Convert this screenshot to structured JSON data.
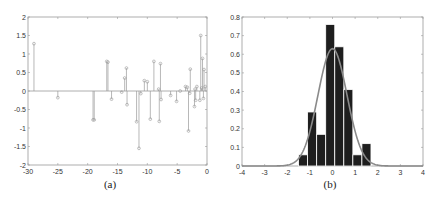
{
  "captions": {
    "a": "(a)",
    "b": "(b)"
  },
  "chart_data": [
    {
      "id": "a",
      "type": "stem",
      "title": "",
      "xlabel": "",
      "ylabel": "",
      "xlim": [
        -30,
        0
      ],
      "ylim": [
        -2,
        2
      ],
      "xticks": [
        -30,
        -25,
        -20,
        -15,
        -10,
        -5,
        0
      ],
      "yticks": [
        -2,
        -1.5,
        -1,
        -0.5,
        0,
        0.5,
        1,
        1.5,
        2
      ],
      "grid": false,
      "color": "#999999",
      "points": [
        {
          "x": -29,
          "y": 1.28
        },
        {
          "x": -25,
          "y": -0.18
        },
        {
          "x": -19.1,
          "y": -0.78
        },
        {
          "x": -18.9,
          "y": -0.78
        },
        {
          "x": -16.8,
          "y": 0.8
        },
        {
          "x": -16.6,
          "y": 0.78
        },
        {
          "x": -16,
          "y": -0.22
        },
        {
          "x": -14.3,
          "y": -0.03
        },
        {
          "x": -13.8,
          "y": 0.35
        },
        {
          "x": -13.5,
          "y": 0.62
        },
        {
          "x": -13.4,
          "y": -0.37
        },
        {
          "x": -11.8,
          "y": -0.83
        },
        {
          "x": -11.4,
          "y": -1.55
        },
        {
          "x": -11.1,
          "y": -0.07
        },
        {
          "x": -10.5,
          "y": 0.28
        },
        {
          "x": -10,
          "y": 0.25
        },
        {
          "x": -9.5,
          "y": -0.76
        },
        {
          "x": -8.9,
          "y": 0.8
        },
        {
          "x": -8.1,
          "y": 0.05
        },
        {
          "x": -8.0,
          "y": -0.82
        },
        {
          "x": -7.8,
          "y": 0.74
        },
        {
          "x": -7.7,
          "y": -0.23
        },
        {
          "x": -6.1,
          "y": -0.12
        },
        {
          "x": -5.1,
          "y": -0.28
        },
        {
          "x": -4.5,
          "y": 0.0
        },
        {
          "x": -3.6,
          "y": 0.12
        },
        {
          "x": -3.3,
          "y": 0.1
        },
        {
          "x": -3.1,
          "y": -1.08
        },
        {
          "x": -2.9,
          "y": -0.06
        },
        {
          "x": -2.8,
          "y": 0.59
        },
        {
          "x": -2.1,
          "y": -0.42
        },
        {
          "x": -2.0,
          "y": 0.05
        },
        {
          "x": -1.9,
          "y": -0.25
        },
        {
          "x": -1.7,
          "y": 0.12
        },
        {
          "x": -1.2,
          "y": -0.25
        },
        {
          "x": -1.05,
          "y": 1.5
        },
        {
          "x": -0.9,
          "y": 0.08
        },
        {
          "x": -0.75,
          "y": 0.88
        },
        {
          "x": -0.6,
          "y": -0.2
        },
        {
          "x": -0.5,
          "y": 0.58
        },
        {
          "x": -0.3,
          "y": 0.12
        }
      ]
    },
    {
      "id": "b",
      "type": "bar",
      "title": "",
      "xlabel": "",
      "ylabel": "",
      "xlim": [
        -4,
        4
      ],
      "ylim": [
        0,
        0.8
      ],
      "xticks": [
        -4,
        -3,
        -2,
        -1,
        0,
        1,
        2,
        3,
        4
      ],
      "yticks": [
        0,
        0.1,
        0.2,
        0.3,
        0.4,
        0.5,
        0.6,
        0.7,
        0.8
      ],
      "grid": false,
      "bar_color": "#1e1e1e",
      "bar_edge": "#ffffff",
      "bin_width": 0.4,
      "bin_centers": [
        -1.3,
        -0.9,
        -0.5,
        -0.1,
        0.3,
        0.7,
        1.1,
        1.5
      ],
      "values": [
        0.06,
        0.29,
        0.17,
        0.76,
        0.64,
        0.41,
        0.06,
        0.12
      ],
      "overlay": {
        "type": "line",
        "name": "normal pdf fit",
        "mean": 0.0,
        "std": 0.64,
        "peak": 0.63,
        "color": "#8a8a8a"
      }
    }
  ]
}
